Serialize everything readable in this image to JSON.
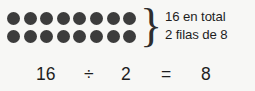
{
  "background_color": "#f7f7f5",
  "ink_color": "#1e1e1e",
  "dot_color": "#3c3c3c",
  "array": {
    "rows": 2,
    "columns": 8,
    "total": 16,
    "row_dots": [
      [
        "dot",
        "dot",
        "dot",
        "dot",
        "dot",
        "dot",
        "dot",
        "dot"
      ],
      [
        "dot",
        "dot",
        "dot",
        "dot",
        "dot",
        "dot",
        "dot",
        "dot"
      ]
    ]
  },
  "brace": {
    "glyph": "}"
  },
  "annotation": {
    "line1": "16 en total",
    "line2": "2 filas de 8"
  },
  "equation": {
    "dividend": "16",
    "operator": "÷",
    "divisor": "2",
    "equals": "=",
    "quotient": "8"
  }
}
